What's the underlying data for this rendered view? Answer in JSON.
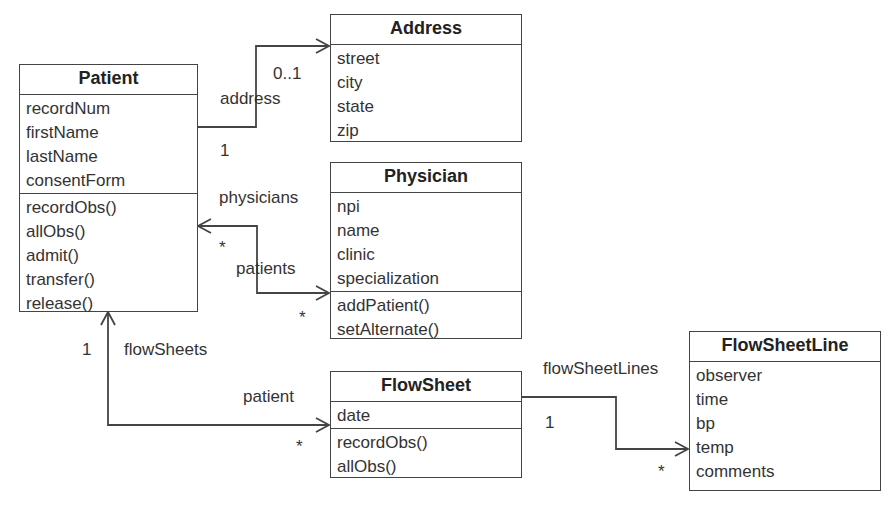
{
  "diagram": {
    "type": "UML class diagram",
    "classes": {
      "patient": {
        "name": "Patient",
        "attributes": [
          "recordNum",
          "firstName",
          "lastName",
          "consentForm"
        ],
        "operations": [
          "recordObs()",
          "allObs()",
          "admit()",
          "transfer()",
          "release()"
        ]
      },
      "address": {
        "name": "Address",
        "attributes": [
          "street",
          "city",
          "state",
          "zip"
        ]
      },
      "physician": {
        "name": "Physician",
        "attributes": [
          "npi",
          "name",
          "clinic",
          "specialization"
        ],
        "operations": [
          "addPatient()",
          "setAlternate()"
        ]
      },
      "flowsheet": {
        "name": "FlowSheet",
        "attributes": [
          "date"
        ],
        "operations": [
          "recordObs()",
          "allObs()"
        ]
      },
      "flowsheetline": {
        "name": "FlowSheetLine",
        "attributes": [
          "observer",
          "time",
          "bp",
          "temp",
          "comments"
        ]
      }
    },
    "associations": {
      "patient_address": {
        "role": "address",
        "source_multiplicity": "1",
        "target_multiplicity": "0..1"
      },
      "patient_physician": {
        "role_at_patient": "physicians",
        "role_at_physician": "patients",
        "multiplicity_at_patient": "*",
        "multiplicity_at_physician": "*"
      },
      "patient_flowsheet": {
        "role_at_patient": "flowSheets",
        "role_at_flowsheet": "patient",
        "multiplicity_at_patient": "1",
        "multiplicity_at_flowsheet": "*"
      },
      "flowsheet_flowsheetline": {
        "role": "flowSheetLines",
        "source_multiplicity": "1",
        "target_multiplicity": "*"
      }
    },
    "colors": {
      "line": "#444444",
      "text": "#333333",
      "background": "#ffffff"
    }
  }
}
